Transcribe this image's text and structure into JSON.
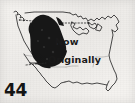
{
  "figure": {
    "number": "44",
    "kind": "range-map",
    "region_depicted": "Contiguous United States",
    "background_color": "#f4f2ef",
    "ink_color": "#1a1a1a",
    "shaded_range_color": "#171717"
  },
  "map": {
    "outline_name": "united-states-outline",
    "outline_stroke": "#2b2b2b",
    "shaded_region_name": "species-range-shaded-area",
    "shaded_region_description": "Dark filled band across the Rocky Mountain and Great Plains interior"
  },
  "annotations": {
    "now": {
      "text": "Now",
      "leader_name": "leader-line-now",
      "leader_style": "dotted"
    },
    "originally": {
      "text": "Originally",
      "leader_name": "leader-line-originally",
      "leader_style": "dotted"
    }
  },
  "leaders": {
    "upper_left": {
      "name": "leader-line-upper-left",
      "style": "dotted"
    }
  }
}
